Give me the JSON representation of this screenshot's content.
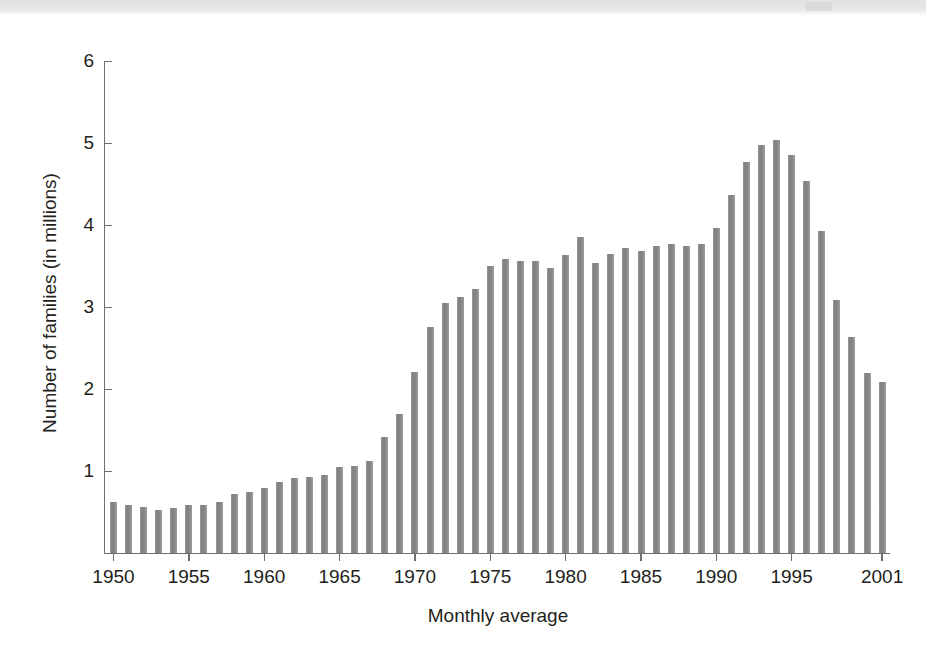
{
  "figure": {
    "background_color": "#ffffff",
    "bar_color": "#878787",
    "axis_color": "#6f6f6f",
    "text_color": "#231f20",
    "top_band_color": "#e4e4e4"
  },
  "chart_data": {
    "type": "bar",
    "title": "",
    "xlabel": "Monthly average",
    "ylabel": "Number of families (in millions)",
    "ylim": [
      0,
      6
    ],
    "y_ticks": [
      1,
      2,
      3,
      4,
      5,
      6
    ],
    "y_tick_labels": [
      "1",
      "2",
      "3",
      "4",
      "5",
      "6"
    ],
    "x_tick_labels": [
      "1950",
      "1955",
      "1960",
      "1965",
      "1970",
      "1975",
      "1980",
      "1985",
      "1990",
      "1995",
      "2001"
    ],
    "x_ticks": [
      1950,
      1955,
      1960,
      1965,
      1970,
      1975,
      1980,
      1985,
      1990,
      1995,
      2001
    ],
    "grid": false,
    "legend": null,
    "categories": [
      "1950",
      "1951",
      "1952",
      "1953",
      "1954",
      "1955",
      "1956",
      "1957",
      "1958",
      "1959",
      "1960",
      "1961",
      "1962",
      "1963",
      "1964",
      "1965",
      "1966",
      "1967",
      "1968",
      "1969",
      "1970",
      "1971",
      "1972",
      "1973",
      "1974",
      "1975",
      "1976",
      "1977",
      "1978",
      "1979",
      "1980",
      "1981",
      "1982",
      "1983",
      "1984",
      "1985",
      "1986",
      "1987",
      "1988",
      "1989",
      "1990",
      "1991",
      "1992",
      "1993",
      "1994",
      "1995",
      "1996",
      "1997",
      "1998",
      "1999",
      "2000",
      "2001"
    ],
    "values": [
      0.62,
      0.58,
      0.56,
      0.53,
      0.55,
      0.58,
      0.58,
      0.62,
      0.72,
      0.75,
      0.79,
      0.87,
      0.92,
      0.93,
      0.95,
      1.05,
      1.06,
      1.12,
      1.41,
      1.7,
      2.21,
      2.76,
      3.05,
      3.12,
      3.22,
      3.5,
      3.58,
      3.56,
      3.56,
      3.48,
      3.64,
      3.85,
      3.54,
      3.65,
      3.72,
      3.68,
      3.75,
      3.77,
      3.75,
      3.77,
      3.97,
      4.37,
      4.77,
      4.98,
      5.04,
      4.85,
      4.54,
      3.93,
      3.08,
      2.63,
      2.2,
      2.09
    ],
    "value_unit": "millions of families",
    "n_bars": 52,
    "series_note": "Average monthly number of families receiving assistance, 1950 through 2001"
  }
}
